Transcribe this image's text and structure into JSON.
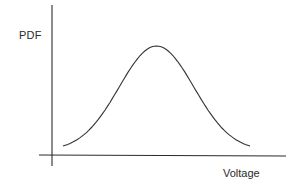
{
  "chart_data": {
    "type": "line",
    "title": "",
    "xlabel": "Voltage",
    "ylabel": "PDF",
    "grid": false,
    "legend": null,
    "ticks": {
      "x": [],
      "y": []
    },
    "series": [
      {
        "name": "PDF",
        "shape": "gaussian",
        "x": [
          0.0,
          0.1,
          0.2,
          0.3,
          0.4,
          0.5,
          0.6,
          0.7,
          0.8,
          0.9,
          1.0
        ],
        "values": [
          0.05,
          0.14,
          0.33,
          0.62,
          0.9,
          1.0,
          0.9,
          0.62,
          0.33,
          0.14,
          0.05
        ]
      }
    ],
    "colors": {
      "axis": "#2b2b2b",
      "curve": "#333333"
    }
  }
}
